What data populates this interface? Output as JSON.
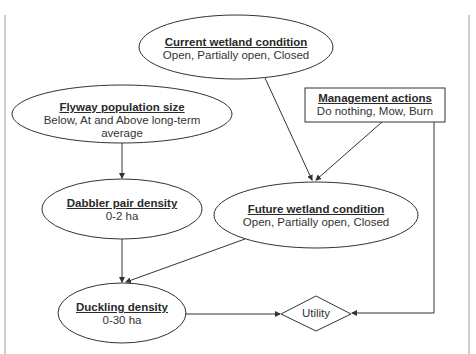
{
  "diagram": {
    "nodes": {
      "current_wetland": {
        "title": "Current wetland condition",
        "subtitle": "Open, Partially open, Closed",
        "shape": "ellipse"
      },
      "flyway": {
        "title": "Flyway population size",
        "subtitle": "Below, At and Above long-term average",
        "shape": "ellipse"
      },
      "management": {
        "title": "Management actions",
        "subtitle": "Do nothing, Mow, Burn",
        "shape": "rectangle"
      },
      "dabbler": {
        "title": "Dabbler pair density",
        "subtitle": "0-2 ha",
        "shape": "ellipse"
      },
      "future_wetland": {
        "title": "Future wetland condition",
        "subtitle": "Open, Partially open, Closed",
        "shape": "ellipse"
      },
      "duckling": {
        "title": "Duckling density",
        "subtitle": "0-30 ha",
        "shape": "ellipse"
      },
      "utility": {
        "label": "Utility",
        "shape": "diamond"
      }
    },
    "edges": [
      {
        "from": "Current wetland condition",
        "to": "Future wetland condition"
      },
      {
        "from": "Management actions",
        "to": "Future wetland condition"
      },
      {
        "from": "Management actions",
        "to": "Utility"
      },
      {
        "from": "Flyway population size",
        "to": "Dabbler pair density"
      },
      {
        "from": "Dabbler pair density",
        "to": "Duckling density"
      },
      {
        "from": "Future wetland condition",
        "to": "Duckling density"
      },
      {
        "from": "Duckling density",
        "to": "Utility"
      }
    ],
    "colors": {
      "stroke": "#333333",
      "frame": "#999999",
      "text": "#333333"
    }
  }
}
